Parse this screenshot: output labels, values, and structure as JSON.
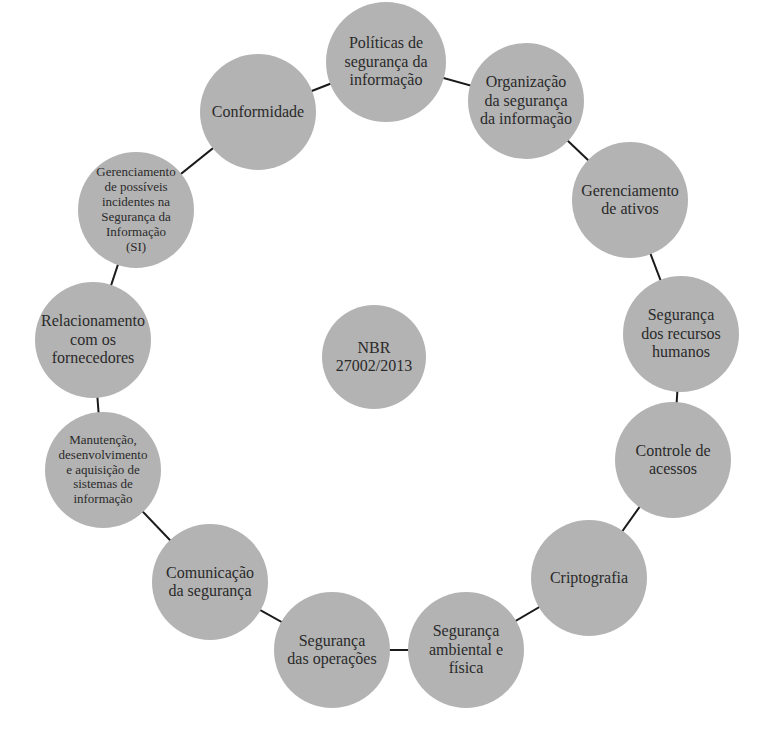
{
  "diagram": {
    "center": {
      "label": "NBR\n27002/2013",
      "x": 374,
      "y": 357,
      "r": 52
    },
    "line_color": "#1a1a1a",
    "node_color": "#b3b3b3",
    "nodes": [
      {
        "label": "Políticas de\nsegurança da\ninformação",
        "x": 386,
        "y": 62,
        "r": 60,
        "small": false
      },
      {
        "label": "Organização\nda segurança\nda informação",
        "x": 526,
        "y": 101,
        "r": 58,
        "small": false
      },
      {
        "label": "Gerenciamento\nde ativos",
        "x": 630,
        "y": 200,
        "r": 58,
        "small": false
      },
      {
        "label": "Segurança\ndos recursos\nhumanos",
        "x": 681,
        "y": 334,
        "r": 58,
        "small": false
      },
      {
        "label": "Controle de\nacessos",
        "x": 673,
        "y": 460,
        "r": 58,
        "small": false
      },
      {
        "label": "Criptografia",
        "x": 589,
        "y": 578,
        "r": 58,
        "small": false
      },
      {
        "label": "Segurança\nambiental e\nfísica",
        "x": 466,
        "y": 650,
        "r": 58,
        "small": false
      },
      {
        "label": "Segurança\ndas operações",
        "x": 332,
        "y": 650,
        "r": 58,
        "small": false
      },
      {
        "label": "Comunicação\nda segurança",
        "x": 210,
        "y": 582,
        "r": 58,
        "small": false
      },
      {
        "label": "Manutenção,\ndesenvolvimento\ne aquisição de\nsistemas de\ninformação",
        "x": 103,
        "y": 470,
        "r": 58,
        "small": true
      },
      {
        "label": "Relacionamento\ncom os\nfornecedores",
        "x": 93,
        "y": 340,
        "r": 58,
        "small": false
      },
      {
        "label": "Gerenciamento\nde possíveis\nincidentes na\nSegurança da\nInformação\n(SI)",
        "x": 136,
        "y": 210,
        "r": 58,
        "small": true
      },
      {
        "label": "Conformidade",
        "x": 258,
        "y": 112,
        "r": 58,
        "small": false
      }
    ]
  }
}
